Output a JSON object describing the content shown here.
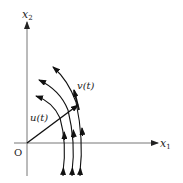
{
  "diagram": {
    "type": "vector-field / phase portrait",
    "axes": {
      "horizontal": {
        "label": "x",
        "subscript": "1"
      },
      "vertical": {
        "label": "x",
        "subscript": "2"
      },
      "origin_label": "O"
    },
    "vectors": [
      {
        "name": "u",
        "label": "u(t)",
        "description": "position vector from origin to point on outer trajectory"
      },
      {
        "name": "v",
        "label": "v(t)",
        "description": "velocity vector tangent to trajectory"
      }
    ],
    "trajectories": {
      "count": 3,
      "description": "concentric arcs rotating counter-clockwise about origin, arrowheads at both ends"
    },
    "colors": {
      "axis": "#777777",
      "curve": "#111111",
      "background": "#ffffff"
    }
  }
}
